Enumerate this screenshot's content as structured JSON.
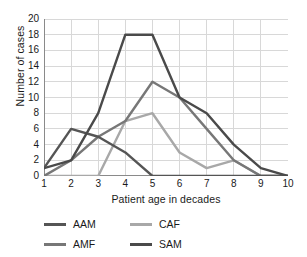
{
  "chart_data": {
    "type": "line",
    "title": "",
    "xlabel": "Patient age in decades",
    "ylabel": "Number of cases",
    "x": [
      1,
      2,
      3,
      4,
      5,
      6,
      7,
      8,
      9,
      10
    ],
    "xticklabels": [
      "1",
      "2",
      "3",
      "4",
      "5",
      "6",
      "7",
      "8",
      "9",
      "10"
    ],
    "yticklabels": [
      "0",
      "2",
      "4",
      "6",
      "8",
      "10",
      "12",
      "14",
      "16",
      "18",
      "20"
    ],
    "ytickvalues": [
      0,
      2,
      4,
      6,
      8,
      10,
      12,
      14,
      16,
      18,
      20
    ],
    "xlim": [
      1,
      10
    ],
    "ylim": [
      0,
      20
    ],
    "grid": "horizontal-and-vertical",
    "legend_position": "bottom-left",
    "series": [
      {
        "name": "AAM",
        "color": "#555555",
        "values": [
          1,
          6,
          5,
          3,
          0,
          0,
          0,
          0,
          0,
          0
        ]
      },
      {
        "name": "AMF",
        "color": "#777777",
        "values": [
          0,
          2,
          5,
          7,
          12,
          10,
          6,
          2,
          0,
          0
        ]
      },
      {
        "name": "CAF",
        "color": "#a8a8a8",
        "values": [
          0,
          0,
          0,
          7,
          8,
          3,
          1,
          2,
          0,
          0
        ]
      },
      {
        "name": "SAM",
        "color": "#4a4a4a",
        "values": [
          1,
          2,
          8,
          18,
          18,
          10,
          8,
          4,
          1,
          0
        ]
      }
    ]
  },
  "legend": {
    "items": [
      {
        "label": "AAM",
        "color": "#555555"
      },
      {
        "label": "CAF",
        "color": "#a8a8a8"
      },
      {
        "label": "AMF",
        "color": "#777777"
      },
      {
        "label": "SAM",
        "color": "#4a4a4a"
      }
    ]
  },
  "style": {
    "grid_color": "#d8d8d8",
    "axis_color": "#8a8a8a",
    "text_color": "#1a1a1a",
    "background": "#ffffff"
  }
}
